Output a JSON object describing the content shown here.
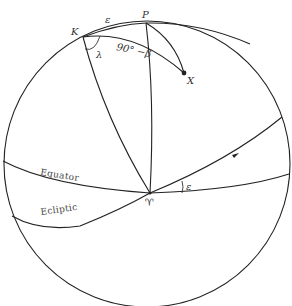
{
  "diagram": {
    "type": "celestial-sphere",
    "points": {
      "ecliptic_pole": "K",
      "celestial_pole": "P",
      "object": "X",
      "vernal_equinox": "♈"
    },
    "labels": {
      "K": "K",
      "P": "P",
      "X": "X",
      "epsilon_top": "ε",
      "lambda": "λ",
      "colatitude": "90° −β",
      "equator": "Equator",
      "ecliptic": "Ecliptic",
      "equinox_symbol": "♈",
      "epsilon_angle": "ε"
    },
    "colors": {
      "stroke": "#222222",
      "background": "#ffffff"
    }
  }
}
